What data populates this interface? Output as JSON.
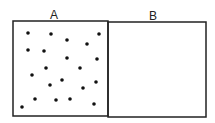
{
  "diagram": {
    "boxes": [
      {
        "label": "A",
        "x": 13,
        "y": 21,
        "w": 95,
        "h": 95,
        "label_x": 54,
        "label_y": 9
      },
      {
        "label": "B",
        "x": 108,
        "y": 22,
        "w": 98,
        "h": 95,
        "label_x": 153,
        "label_y": 10
      }
    ],
    "stroke_color": "#222222",
    "dot_color": "#111111",
    "dots": [
      [
        28,
        33
      ],
      [
        51,
        34
      ],
      [
        67,
        40
      ],
      [
        87,
        44
      ],
      [
        99,
        34
      ],
      [
        28,
        50
      ],
      [
        44,
        51
      ],
      [
        67,
        58
      ],
      [
        97,
        59
      ],
      [
        46,
        68
      ],
      [
        80,
        68
      ],
      [
        32,
        75
      ],
      [
        62,
        80
      ],
      [
        50,
        85
      ],
      [
        83,
        88
      ],
      [
        96,
        82
      ],
      [
        35,
        99
      ],
      [
        56,
        100
      ],
      [
        70,
        99
      ],
      [
        94,
        104
      ],
      [
        22,
        107
      ]
    ]
  }
}
